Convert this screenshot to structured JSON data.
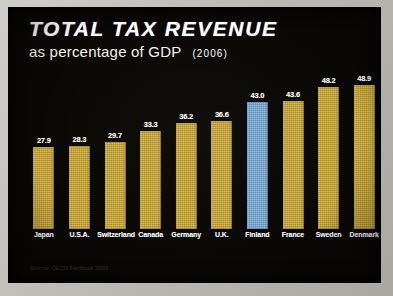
{
  "chart_data": {
    "type": "bar",
    "title": "TOTAL TAX REVENUE",
    "subtitle": "as percentage of GDP",
    "year_annotation": "(2006)",
    "xlabel": "",
    "ylabel": "",
    "ylim": [
      0,
      52
    ],
    "grid": false,
    "legend": "none",
    "source": "Source: OECD Factbook 2009",
    "categories": [
      "Japan",
      "U.S.A.",
      "Switzerland",
      "Canada",
      "Germany",
      "U.K.",
      "Finland",
      "France",
      "Sweden",
      "Denmark"
    ],
    "values": [
      27.9,
      28.3,
      29.7,
      33.3,
      36.2,
      36.6,
      43.0,
      43.6,
      48.2,
      48.9
    ],
    "value_labels": [
      "27.9",
      "28.3",
      "29.7",
      "33.3",
      "36.2",
      "36.6",
      "43.0",
      "43.6",
      "48.2",
      "48.9"
    ],
    "highlight_index": 6,
    "colors": {
      "background": "#0a0805",
      "frame": "#bdbdb6",
      "bar": "#d4b139",
      "bar_highlight": "#7fb2dc",
      "title_text": "#ffffff",
      "label_text": "#ffffff",
      "source_text": "#3d3a33"
    }
  }
}
